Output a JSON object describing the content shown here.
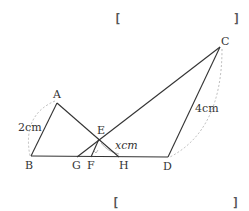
{
  "diagram": {
    "points": {
      "A": {
        "label": "A",
        "x": 57,
        "y": 103
      },
      "B": {
        "label": "B",
        "x": 31,
        "y": 156
      },
      "C": {
        "label": "C",
        "x": 220,
        "y": 47
      },
      "D": {
        "label": "D",
        "x": 168,
        "y": 157
      },
      "E": {
        "label": "E",
        "x": 99,
        "y": 139
      },
      "F": {
        "label": "F",
        "x": 91,
        "y": 157
      },
      "G": {
        "label": "G",
        "x": 77,
        "y": 157
      },
      "H": {
        "label": "H",
        "x": 119,
        "y": 157
      }
    },
    "measures": {
      "AB": "2cm",
      "CD": "4cm",
      "EF": "xcm"
    },
    "answer_brackets": [
      {
        "open": "[",
        "close": "]"
      },
      {
        "open": "[",
        "close": "]"
      }
    ]
  }
}
